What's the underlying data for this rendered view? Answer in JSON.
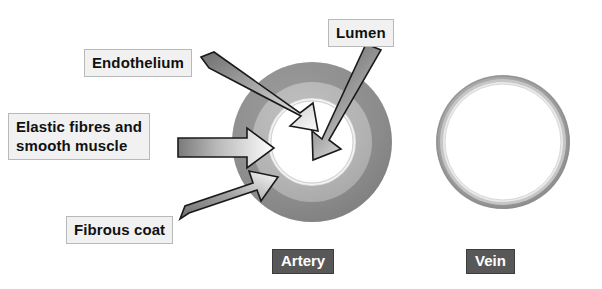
{
  "diagram": {
    "background_color": "#ffffff",
    "callouts": [
      {
        "id": "endothelium",
        "text": "Endothelium",
        "bg": "#f1f1f1",
        "border": "#b9b9b9",
        "fg": "#111111"
      },
      {
        "id": "elastic",
        "line1": "Elastic fibres and",
        "line2": "smooth muscle",
        "bg": "#f1f1f1",
        "border": "#b9b9b9",
        "fg": "#111111"
      },
      {
        "id": "fibrous",
        "text": "Fibrous coat",
        "bg": "#f1f1f1",
        "border": "#b9b9b9",
        "fg": "#111111"
      },
      {
        "id": "lumen",
        "text": "Lumen",
        "bg": "#f1f1f1",
        "border": "#b9b9b9",
        "fg": "#111111"
      }
    ],
    "labels": {
      "endothelium": "Endothelium",
      "elastic_line1": "Elastic fibres and",
      "elastic_line2": "smooth muscle",
      "fibrous": "Fibrous coat",
      "lumen": "Lumen",
      "artery": "Artery",
      "vein": "Vein"
    },
    "nametags": {
      "artery": "Artery",
      "vein": "Vein",
      "bg": "#585858",
      "fg": "#ffffff"
    },
    "artery": {
      "name": "Artery",
      "center_x": 312,
      "center_y": 142,
      "layers": [
        {
          "name": "Fibrous coat",
          "outer_radius": 80,
          "inner_radius": 60,
          "color": "#8e8e8e"
        },
        {
          "name": "Elastic fibres and smooth muscle",
          "outer_radius": 60,
          "inner_radius": 44,
          "color": "#b4b4b4"
        },
        {
          "name": "Endothelium",
          "outer_radius": 44,
          "inner_radius": 41,
          "color": "#dcdcdc"
        },
        {
          "name": "Lumen",
          "outer_radius": 41,
          "inner_radius": 0,
          "color": "#ffffff"
        }
      ]
    },
    "vein": {
      "name": "Vein",
      "center_x": 503,
      "center_y": 142,
      "layers": [
        {
          "name": "Fibrous coat",
          "outer_radius": 67,
          "inner_radius": 63,
          "color": "#9a9a9a"
        },
        {
          "name": "Elastic fibres and smooth muscle",
          "outer_radius": 63,
          "inner_radius": 60,
          "color": "#c8c8c8"
        },
        {
          "name": "Endothelium",
          "outer_radius": 60,
          "inner_radius": 58,
          "color": "#e6e6e6"
        },
        {
          "name": "Lumen",
          "outer_radius": 58,
          "inner_radius": 0,
          "color": "#ffffff"
        }
      ]
    },
    "arrows": [
      {
        "name": "endothelium-arrow",
        "from_label": "Endothelium",
        "points_to": "Endothelium layer",
        "style": "3d-shaded",
        "direction": "down-right"
      },
      {
        "name": "elastic-arrow",
        "from_label": "Elastic fibres and smooth muscle",
        "points_to": "Middle muscular layer",
        "style": "3d-shaded",
        "direction": "right"
      },
      {
        "name": "fibrous-arrow",
        "from_label": "Fibrous coat",
        "points_to": "Outer fibrous coat",
        "style": "3d-shaded",
        "direction": "up-right"
      },
      {
        "name": "lumen-arrow",
        "from_label": "Lumen",
        "points_to": "Central lumen",
        "style": "3d-shaded",
        "direction": "down-left"
      }
    ],
    "colors": {
      "fibrous_coat": "#8e8e8e",
      "smooth_muscle": "#b4b4b4",
      "endothelium": "#dcdcdc",
      "lumen": "#ffffff",
      "arrow_outline": "#1a1a1a",
      "label_bg": "#f1f1f1",
      "nametag_bg": "#585858"
    }
  }
}
